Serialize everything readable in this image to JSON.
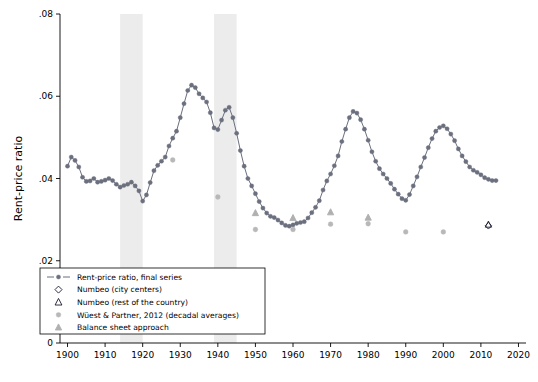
{
  "chart_data": {
    "type": "line",
    "title": "",
    "xlabel": "",
    "ylabel": "Rent-price ratio",
    "xlim": [
      1898,
      2022
    ],
    "ylim": [
      0,
      0.08
    ],
    "xticks": [
      1900,
      1910,
      1920,
      1930,
      1940,
      1950,
      1960,
      1970,
      1980,
      1990,
      2000,
      2010,
      2020
    ],
    "yticks": [
      0,
      0.02,
      0.04,
      0.06,
      0.08
    ],
    "ytick_labels": [
      "0",
      ".02",
      ".04",
      ".06",
      ".08"
    ],
    "grid": false,
    "legend_position": "bottom-left",
    "shaded_bands": [
      {
        "x0": 1914,
        "x1": 1920,
        "color": "#ececec"
      },
      {
        "x0": 1939,
        "x1": 1945,
        "color": "#ececec"
      }
    ],
    "series": [
      {
        "name": "Rent-price ratio, final series",
        "type": "line-marker",
        "color": "#6b6f7e",
        "marker": "circle",
        "x": [
          1900,
          1901,
          1902,
          1903,
          1904,
          1905,
          1906,
          1907,
          1908,
          1909,
          1910,
          1911,
          1912,
          1913,
          1914,
          1915,
          1916,
          1917,
          1918,
          1919,
          1920,
          1921,
          1922,
          1923,
          1924,
          1925,
          1926,
          1927,
          1928,
          1929,
          1930,
          1931,
          1932,
          1933,
          1934,
          1935,
          1936,
          1937,
          1938,
          1939,
          1940,
          1941,
          1942,
          1943,
          1944,
          1945,
          1946,
          1947,
          1948,
          1949,
          1950,
          1951,
          1952,
          1953,
          1954,
          1955,
          1956,
          1957,
          1958,
          1959,
          1960,
          1961,
          1962,
          1963,
          1964,
          1965,
          1966,
          1967,
          1968,
          1969,
          1970,
          1971,
          1972,
          1973,
          1974,
          1975,
          1976,
          1977,
          1978,
          1979,
          1980,
          1981,
          1982,
          1983,
          1984,
          1985,
          1986,
          1987,
          1988,
          1989,
          1990,
          1991,
          1992,
          1993,
          1994,
          1995,
          1996,
          1997,
          1998,
          1999,
          2000,
          2001,
          2002,
          2003,
          2004,
          2005,
          2006,
          2007,
          2008,
          2009,
          2010,
          2011,
          2012,
          2013,
          2014
        ],
        "y": [
          0.043,
          0.0452,
          0.0444,
          0.0428,
          0.0403,
          0.0393,
          0.0394,
          0.04,
          0.0391,
          0.0393,
          0.0396,
          0.04,
          0.0395,
          0.0386,
          0.0379,
          0.0383,
          0.0386,
          0.0391,
          0.0382,
          0.037,
          0.0345,
          0.036,
          0.039,
          0.0419,
          0.0432,
          0.0442,
          0.0452,
          0.0479,
          0.0498,
          0.0515,
          0.0548,
          0.0582,
          0.0614,
          0.0627,
          0.0621,
          0.0606,
          0.0596,
          0.0586,
          0.056,
          0.0523,
          0.0519,
          0.0542,
          0.0566,
          0.0573,
          0.0548,
          0.051,
          0.0468,
          0.043,
          0.04,
          0.0382,
          0.0363,
          0.0344,
          0.0328,
          0.0316,
          0.0308,
          0.0305,
          0.0299,
          0.0292,
          0.0286,
          0.0284,
          0.0287,
          0.0291,
          0.0293,
          0.0295,
          0.0304,
          0.0317,
          0.033,
          0.0346,
          0.0372,
          0.0394,
          0.0411,
          0.0431,
          0.0455,
          0.049,
          0.052,
          0.0548,
          0.0563,
          0.0559,
          0.0543,
          0.052,
          0.0493,
          0.0465,
          0.0442,
          0.0424,
          0.0411,
          0.04,
          0.0388,
          0.0374,
          0.0362,
          0.0351,
          0.0347,
          0.0361,
          0.0382,
          0.0404,
          0.0428,
          0.0451,
          0.0475,
          0.0497,
          0.0515,
          0.0524,
          0.0528,
          0.0521,
          0.0508,
          0.0492,
          0.0472,
          0.0455,
          0.0441,
          0.0428,
          0.042,
          0.0415,
          0.0409,
          0.0402,
          0.0398,
          0.0395,
          0.0395
        ]
      },
      {
        "name": "Numbeo (city centers)",
        "type": "scatter",
        "color": "#1a1a2e",
        "marker": "diamond",
        "x": [
          2012
        ],
        "y": [
          0.0285
        ]
      },
      {
        "name": "Numbeo (rest of the country)",
        "type": "scatter",
        "color": "#1a1a2e",
        "marker": "triangle",
        "x": [
          2012
        ],
        "y": [
          0.0288
        ]
      },
      {
        "name": "Wüest & Partner, 2012 (decadal averages)",
        "type": "scatter",
        "color": "#b8b8b8",
        "marker": "circle",
        "x": [
          1928,
          1940,
          1950,
          1960,
          1970,
          1980,
          1990,
          2000
        ],
        "y": [
          0.0445,
          0.0355,
          0.0276,
          0.0276,
          0.0289,
          0.029,
          0.027,
          0.027
        ]
      },
      {
        "name": "Balance sheet approach",
        "type": "scatter",
        "color": "#b0b0b0",
        "marker": "triangle",
        "x": [
          1950,
          1960,
          1970,
          1980
        ],
        "y": [
          0.0316,
          0.0304,
          0.0318,
          0.0305
        ]
      }
    ],
    "legend": [
      {
        "label": "Rent-price ratio, final series",
        "marker": "line-circle",
        "color": "#6b6f7e"
      },
      {
        "label": "Numbeo (city centers)",
        "marker": "diamond-open",
        "color": "#1a1a2e"
      },
      {
        "label": "Numbeo (rest of the country)",
        "marker": "triangle-open",
        "color": "#1a1a2e"
      },
      {
        "label": "Wüest & Partner, 2012 (decadal averages)",
        "marker": "circle",
        "color": "#b8b8b8"
      },
      {
        "label": "Balance sheet approach",
        "marker": "triangle",
        "color": "#b0b0b0"
      }
    ]
  }
}
